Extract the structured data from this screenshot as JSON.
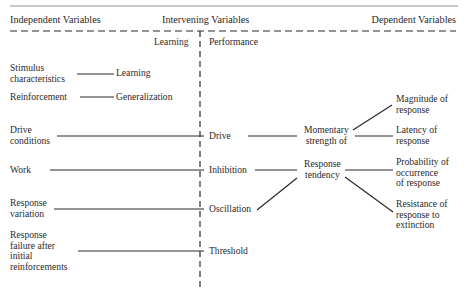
{
  "headers": {
    "independent": "Independent Variables",
    "intervening": "Intervening Variables",
    "dependent": "Dependent Variables",
    "learning": "Learning",
    "performance": "Performance"
  },
  "independent_variables": [
    {
      "lines": [
        "Stimulus",
        "characteristics"
      ]
    },
    {
      "lines": [
        "Reinforcement"
      ]
    },
    {
      "lines": [
        "Drive",
        "conditions"
      ]
    },
    {
      "lines": [
        "Work"
      ]
    },
    {
      "lines": [
        "Response",
        "variation"
      ]
    },
    {
      "lines": [
        "Response",
        "failure after",
        "initial",
        "reinforcements"
      ]
    }
  ],
  "learning_variables": [
    "Learning",
    "Generalization"
  ],
  "performance_variables": [
    "Drive",
    "Inhibition",
    "Oscillation",
    "Threshold"
  ],
  "combined_variables": {
    "momentary": [
      "Momentary",
      "strength of"
    ],
    "tendency": [
      "Response",
      "tendency"
    ]
  },
  "dependent_variables": [
    {
      "lines": [
        "Magnitude of",
        "response"
      ]
    },
    {
      "lines": [
        "Latency of",
        "response"
      ]
    },
    {
      "lines": [
        "Probability of",
        "occurrence",
        "of response"
      ]
    },
    {
      "lines": [
        "Resistance of",
        "response to",
        "extinction"
      ]
    }
  ],
  "colors": {
    "ink": "#2a2a2a",
    "background": "#ffffff"
  }
}
